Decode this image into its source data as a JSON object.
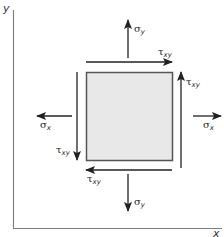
{
  "diagram": {
    "type": "plane-stress-element",
    "axes": {
      "x_label": "x",
      "y_label": "y"
    },
    "element": {
      "fill_color": "#e8e8e8",
      "border_color": "#555555"
    },
    "stresses": {
      "sigma_y_top": {
        "symbol": "σ",
        "subscript": "y",
        "direction": "up"
      },
      "sigma_y_bottom": {
        "symbol": "σ",
        "subscript": "y",
        "direction": "down"
      },
      "sigma_x_left": {
        "symbol": "σ",
        "subscript": "x",
        "direction": "left"
      },
      "sigma_x_right": {
        "symbol": "σ",
        "subscript": "x",
        "direction": "right"
      },
      "tau_xy_top": {
        "symbol": "τ",
        "subscript": "xy",
        "direction": "right"
      },
      "tau_xy_right": {
        "symbol": "τ",
        "subscript": "xy",
        "direction": "up"
      },
      "tau_xy_bottom": {
        "symbol": "τ",
        "subscript": "xy",
        "direction": "left"
      },
      "tau_xy_left": {
        "symbol": "τ",
        "subscript": "xy",
        "direction": "down"
      }
    },
    "colors": {
      "arrow": "#222222",
      "axis": "#777777"
    }
  }
}
